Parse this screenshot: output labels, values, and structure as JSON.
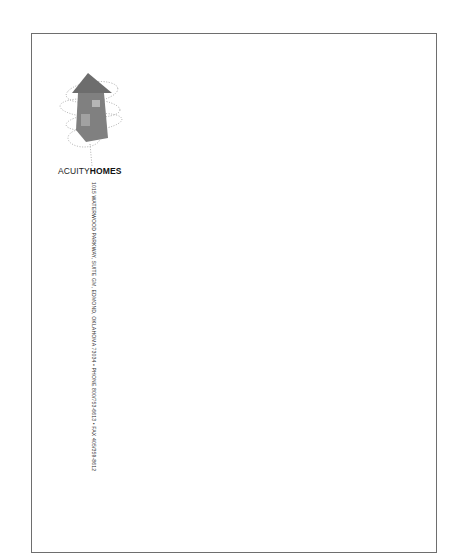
{
  "letterhead": {
    "brand": {
      "light": "ACUITY",
      "bold": "HOMES"
    },
    "address_line": "1015 WATERWOOD PARKWAY, SUITE GM, EDMOND, OKLAHOMA 73034 • PHONE 800/753-6613 • FAX 405/359-8612",
    "logo_icon": "house-arrow-icon",
    "colors": {
      "border": "#6e6e6e",
      "logo_fill": "#7a7a7a",
      "logo_window": "#a8a8a8",
      "text": "#222222"
    }
  }
}
